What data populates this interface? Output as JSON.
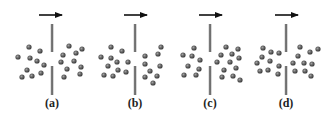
{
  "figure": {
    "colors": {
      "particle": "#5a5a5a",
      "particle_highlight": "#9a9a9a",
      "barrier_dark": "#555555",
      "barrier_light": "#c8c8c8",
      "arrow": "#111111"
    },
    "panels": [
      {
        "label": "(a)",
        "center_x": 52,
        "arrow": {
          "x1": 39,
          "x2": 62,
          "y": 15
        },
        "barrier": {
          "top": [
            24,
            52
          ],
          "bottom": [
            66,
            95
          ]
        },
        "particles": [
          [
            29,
            47
          ],
          [
            40,
            51
          ],
          [
            18,
            57
          ],
          [
            30,
            58
          ],
          [
            37,
            61
          ],
          [
            44,
            65
          ],
          [
            27,
            70
          ],
          [
            41,
            73
          ],
          [
            22,
            77
          ],
          [
            32,
            76
          ],
          [
            69,
            46
          ],
          [
            82,
            49
          ],
          [
            63,
            55
          ],
          [
            76,
            53
          ],
          [
            61,
            62
          ],
          [
            74,
            61
          ],
          [
            81,
            67
          ],
          [
            67,
            69
          ],
          [
            80,
            74
          ],
          [
            64,
            77
          ]
        ]
      },
      {
        "label": "(b)",
        "center_x": 135,
        "arrow": {
          "x1": 124,
          "x2": 147,
          "y": 15
        },
        "barrier": {
          "top": [
            24,
            52
          ],
          "bottom": [
            66,
            95
          ]
        },
        "particles": [
          [
            111,
            47
          ],
          [
            122,
            51
          ],
          [
            101,
            57
          ],
          [
            111,
            58
          ],
          [
            117,
            62
          ],
          [
            128,
            62
          ],
          [
            108,
            66
          ],
          [
            118,
            70
          ],
          [
            126,
            72
          ],
          [
            104,
            75
          ],
          [
            113,
            76
          ],
          [
            161,
            47
          ],
          [
            158,
            54
          ],
          [
            145,
            56
          ],
          [
            145,
            64
          ],
          [
            160,
            66
          ],
          [
            150,
            71
          ],
          [
            145,
            77
          ],
          [
            157,
            76
          ],
          [
            153,
            83
          ]
        ]
      },
      {
        "label": "(c)",
        "center_x": 210,
        "arrow": {
          "x1": 199,
          "x2": 222,
          "y": 15
        },
        "barrier": {
          "top": [
            24,
            52
          ],
          "bottom": [
            66,
            95
          ]
        },
        "particles": [
          [
            194,
            48
          ],
          [
            183,
            55
          ],
          [
            192,
            56
          ],
          [
            200,
            60
          ],
          [
            188,
            66
          ],
          [
            199,
            69
          ],
          [
            184,
            75
          ],
          [
            196,
            75
          ],
          [
            226,
            47
          ],
          [
            238,
            49
          ],
          [
            221,
            55
          ],
          [
            232,
            54
          ],
          [
            239,
            58
          ],
          [
            217,
            62
          ],
          [
            230,
            62
          ],
          [
            224,
            70
          ],
          [
            236,
            68
          ],
          [
            222,
            77
          ],
          [
            233,
            76
          ],
          [
            240,
            80
          ]
        ]
      },
      {
        "label": "(d)",
        "center_x": 286,
        "arrow": {
          "x1": 275,
          "x2": 298,
          "y": 15
        },
        "barrier": {
          "top": [
            24,
            52
          ],
          "bottom": [
            66,
            95
          ]
        },
        "particles": [
          [
            263,
            48
          ],
          [
            271,
            52
          ],
          [
            279,
            53
          ],
          [
            262,
            57
          ],
          [
            257,
            63
          ],
          [
            270,
            61
          ],
          [
            279,
            66
          ],
          [
            260,
            71
          ],
          [
            268,
            70
          ],
          [
            278,
            74
          ],
          [
            300,
            47
          ],
          [
            310,
            52
          ],
          [
            318,
            49
          ],
          [
            298,
            56
          ],
          [
            293,
            63
          ],
          [
            304,
            63
          ],
          [
            312,
            64
          ],
          [
            295,
            71
          ],
          [
            305,
            71
          ],
          [
            311,
            76
          ]
        ]
      }
    ]
  }
}
